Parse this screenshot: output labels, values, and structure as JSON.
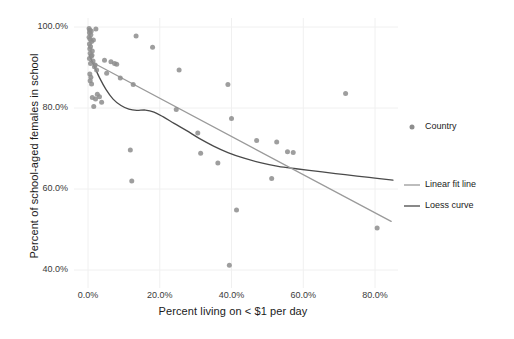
{
  "chart_data": {
    "type": "scatter",
    "title": "",
    "xlabel": "Percent living on < $1 per day",
    "ylabel": "Percent of school-aged females in school",
    "xlim": [
      -4,
      88
    ],
    "ylim": [
      38,
      103
    ],
    "xticks": [
      "0.0%",
      "20.0%",
      "40.0%",
      "60.0%",
      "80.0%"
    ],
    "xtick_values": [
      0,
      20,
      40,
      60,
      80
    ],
    "yticks": [
      "40.0%",
      "60.0%",
      "80.0%",
      "100.0%"
    ],
    "ytick_values": [
      40,
      60,
      80,
      100
    ],
    "grid": true,
    "legend_position": "right",
    "point_color": "#8d8d8d",
    "linear_color": "#9a9a9a",
    "loess_color": "#4a4a4a",
    "legend": [
      {
        "label": "Country",
        "marker": "point",
        "color": "#8d8d8d"
      },
      {
        "label": "Linear fit line",
        "marker": "line",
        "color": "#9a9a9a"
      },
      {
        "label": "Loess curve",
        "marker": "line",
        "color": "#4a4a4a"
      }
    ],
    "series": [
      {
        "name": "Country",
        "type": "scatter",
        "points": [
          [
            0.3,
            99.6
          ],
          [
            0.5,
            99.2
          ],
          [
            0.4,
            98.6
          ],
          [
            0.8,
            98.1
          ],
          [
            0.3,
            97.5
          ],
          [
            0.6,
            97.0
          ],
          [
            1.0,
            96.4
          ],
          [
            0.4,
            95.8
          ],
          [
            0.7,
            95.2
          ],
          [
            0.5,
            94.6
          ],
          [
            1.2,
            94.1
          ],
          [
            0.6,
            93.5
          ],
          [
            0.9,
            92.8
          ],
          [
            0.4,
            92.2
          ],
          [
            1.4,
            91.6
          ],
          [
            0.7,
            91.0
          ],
          [
            2.2,
            99.5
          ],
          [
            2.0,
            90.6
          ],
          [
            0.5,
            88.4
          ],
          [
            0.8,
            87.6
          ],
          [
            0.6,
            86.7
          ],
          [
            1.0,
            85.9
          ],
          [
            1.2,
            82.6
          ],
          [
            2.1,
            82.2
          ],
          [
            2.6,
            83.4
          ],
          [
            3.2,
            82.8
          ],
          [
            1.6,
            80.4
          ],
          [
            3.8,
            81.4
          ],
          [
            4.6,
            91.8
          ],
          [
            6.4,
            91.4
          ],
          [
            7.4,
            91.0
          ],
          [
            8.0,
            90.8
          ],
          [
            5.2,
            88.6
          ],
          [
            9.0,
            87.4
          ],
          [
            13.4,
            97.8
          ],
          [
            18.0,
            95.0
          ],
          [
            12.6,
            85.8
          ],
          [
            11.8,
            69.6
          ],
          [
            12.2,
            62.0
          ],
          [
            25.4,
            89.4
          ],
          [
            24.6,
            79.6
          ],
          [
            30.6,
            73.8
          ],
          [
            39.0,
            85.8
          ],
          [
            31.4,
            68.8
          ],
          [
            40.0,
            77.4
          ],
          [
            36.2,
            66.4
          ],
          [
            41.4,
            54.8
          ],
          [
            39.4,
            41.2
          ],
          [
            47.0,
            72.0
          ],
          [
            52.6,
            71.6
          ],
          [
            55.6,
            69.2
          ],
          [
            57.2,
            69.0
          ],
          [
            51.2,
            62.6
          ],
          [
            71.8,
            83.6
          ],
          [
            80.6,
            50.4
          ],
          [
            1.8,
            90.2
          ],
          [
            2.4,
            89.4
          ],
          [
            1.1,
            93.0
          ],
          [
            0.9,
            99.0
          ],
          [
            1.5,
            96.8
          ]
        ]
      },
      {
        "name": "Linear fit line",
        "type": "line",
        "points": [
          [
            0.5,
            91.6
          ],
          [
            84.5,
            52.0
          ]
        ]
      },
      {
        "name": "Loess curve",
        "type": "line",
        "points": [
          [
            0.4,
            93.0
          ],
          [
            1.6,
            90.6
          ],
          [
            3.2,
            87.5
          ],
          [
            5.0,
            84.6
          ],
          [
            7.0,
            82.2
          ],
          [
            9.2,
            80.6
          ],
          [
            11.4,
            79.7
          ],
          [
            13.6,
            79.4
          ],
          [
            16.0,
            79.5
          ],
          [
            18.4,
            79.0
          ],
          [
            21.0,
            77.8
          ],
          [
            24.0,
            76.2
          ],
          [
            27.5,
            74.4
          ],
          [
            31.0,
            72.5
          ],
          [
            35.0,
            70.6
          ],
          [
            39.0,
            69.0
          ],
          [
            43.5,
            67.6
          ],
          [
            48.0,
            66.5
          ],
          [
            53.0,
            65.6
          ],
          [
            58.0,
            65.0
          ],
          [
            63.5,
            64.4
          ],
          [
            69.0,
            63.8
          ],
          [
            75.0,
            63.2
          ],
          [
            80.0,
            62.7
          ],
          [
            85.0,
            62.2
          ]
        ]
      }
    ]
  }
}
